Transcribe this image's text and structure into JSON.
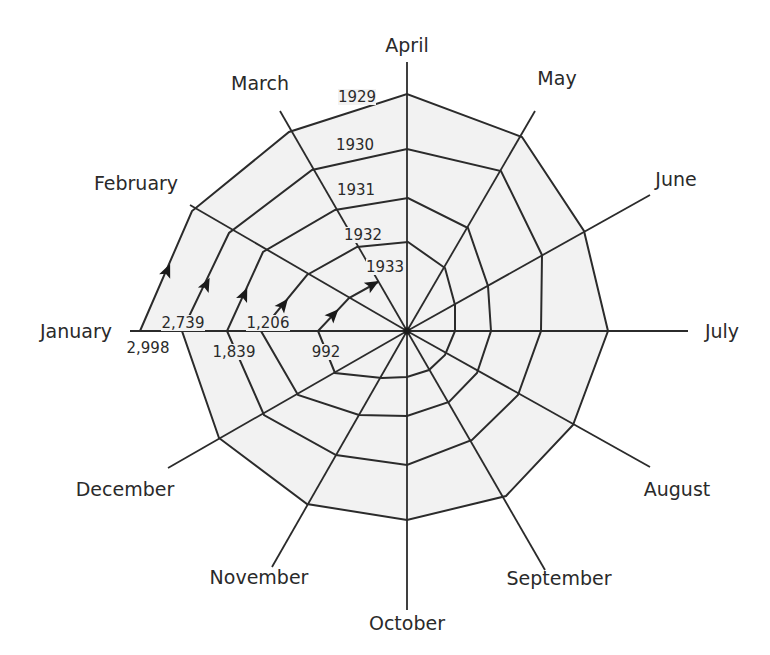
{
  "chart_data": {
    "type": "spiral",
    "title": "",
    "title_visible_fragment": "(partially cropped title at top edge, illegible)",
    "center": [
      407,
      331
    ],
    "colors": {
      "line": "#2b2b2b",
      "fill": "#f2f2f2",
      "text": "#2a2a2a"
    },
    "months": [
      "January",
      "February",
      "March",
      "April",
      "May",
      "June",
      "July",
      "August",
      "September",
      "October",
      "November",
      "December"
    ],
    "axis_ends": [
      [
        130,
        331
      ],
      [
        190,
        205
      ],
      [
        280,
        111
      ],
      [
        407,
        62
      ],
      [
        535,
        111
      ],
      [
        650,
        195
      ],
      [
        688,
        331
      ],
      [
        650,
        467
      ],
      [
        545,
        570
      ],
      [
        407,
        610
      ],
      [
        272,
        567
      ],
      [
        168,
        468
      ]
    ],
    "month_label_pos": [
      [
        76,
        338
      ],
      [
        136,
        190
      ],
      [
        260,
        90
      ],
      [
        407,
        52
      ],
      [
        557,
        85
      ],
      [
        676,
        186
      ],
      [
        722,
        338
      ],
      [
        677,
        496
      ],
      [
        559,
        585
      ],
      [
        407,
        630
      ],
      [
        259,
        584
      ],
      [
        125,
        496
      ]
    ],
    "years": [
      "1929",
      "1930",
      "1931",
      "1932",
      "1933"
    ],
    "year_label_pos": [
      [
        357,
        102
      ],
      [
        355,
        150
      ],
      [
        356,
        195
      ],
      [
        363,
        240
      ],
      [
        385,
        272
      ]
    ],
    "january_values": [
      {
        "year": "1929",
        "value": "2,998",
        "pos": [
          148,
          353
        ]
      },
      {
        "year": "1930",
        "value": "2,739",
        "pos": [
          183,
          328
        ]
      },
      {
        "year": "1931",
        "value": "1,839",
        "pos": [
          234,
          357
        ]
      },
      {
        "year": "1932",
        "value": "1,206",
        "pos": [
          268,
          328
        ]
      },
      {
        "year": "1933",
        "value": "992",
        "pos": [
          326,
          357
        ]
      }
    ],
    "spiral_path": [
      [
        140,
        331
      ],
      [
        192,
        211
      ],
      [
        289,
        132
      ],
      [
        407,
        94
      ],
      [
        522,
        137
      ],
      [
        584,
        231
      ],
      [
        608,
        331
      ],
      [
        573,
        425
      ],
      [
        506,
        496
      ],
      [
        407,
        520
      ],
      [
        307,
        504
      ],
      [
        219,
        438
      ],
      [
        182,
        331
      ],
      [
        229,
        233
      ],
      [
        312,
        170
      ],
      [
        407,
        149
      ],
      [
        501,
        171
      ],
      [
        542,
        255
      ],
      [
        541,
        331
      ],
      [
        518,
        395
      ],
      [
        472,
        440
      ],
      [
        407,
        465
      ],
      [
        336,
        455
      ],
      [
        264,
        415
      ],
      [
        227,
        331
      ],
      [
        263,
        252
      ],
      [
        335,
        210
      ],
      [
        408,
        198
      ],
      [
        468,
        228
      ],
      [
        488,
        286
      ],
      [
        491,
        331
      ],
      [
        477,
        373
      ],
      [
        449,
        402
      ],
      [
        407,
        416
      ],
      [
        359,
        415
      ],
      [
        298,
        395
      ],
      [
        261,
        331
      ],
      [
        307,
        275
      ],
      [
        357,
        247
      ],
      [
        408,
        242
      ],
      [
        445,
        268
      ],
      [
        455,
        305
      ],
      [
        455,
        331
      ],
      [
        445,
        355
      ],
      [
        429,
        370
      ],
      [
        407,
        377
      ],
      [
        382,
        378
      ],
      [
        335,
        373
      ],
      [
        318,
        331
      ],
      [
        349,
        298
      ],
      [
        378,
        282
      ]
    ],
    "arrows": [
      {
        "at": [
          167,
          271
        ],
        "angle": -67
      },
      {
        "at": [
          206,
          285
        ],
        "angle": -63
      },
      {
        "at": [
          244,
          295
        ],
        "angle": -66
      },
      {
        "at": [
          283,
          305
        ],
        "angle": -52
      },
      {
        "at": [
          333,
          315
        ],
        "angle": -47
      },
      {
        "at": [
          372,
          285
        ],
        "angle": -30
      }
    ],
    "xlabel": "",
    "ylabel": "",
    "legend": []
  }
}
